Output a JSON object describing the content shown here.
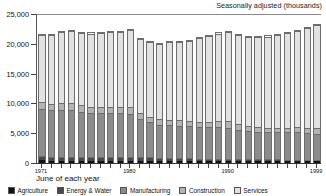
{
  "chart_data": {
    "type": "bar",
    "stacked": true,
    "title": "Seasonally adjusted (thousands)",
    "subtitle": "",
    "xlabel": "June of each year",
    "ylabel": "",
    "ylim": [
      0,
      25000
    ],
    "yticks": [
      0,
      5000,
      10000,
      15000,
      20000,
      25000
    ],
    "ytick_labels": [
      "0",
      "5,000",
      "10,000",
      "15,000",
      "20,000",
      "25,000"
    ],
    "grid": false,
    "legend_position": "bottom",
    "categories": [
      "1971",
      "1972",
      "1973",
      "1974",
      "1975",
      "1976",
      "1977",
      "1978",
      "1979",
      "1980",
      "1981",
      "1982",
      "1983",
      "1984",
      "1985",
      "1986",
      "1987",
      "1988",
      "1989",
      "1990",
      "1991",
      "1992",
      "1993",
      "1994",
      "1995",
      "1996",
      "1997",
      "1998",
      "1999"
    ],
    "xtick_labels": [
      "1971",
      "1980",
      "1990",
      "1999"
    ],
    "xtick_label_indices": [
      0,
      9,
      19,
      28
    ],
    "series": [
      {
        "name": "Agriculture",
        "color": "#121212",
        "values": [
          430,
          420,
          415,
          410,
          400,
          395,
          390,
          385,
          380,
          375,
          360,
          350,
          345,
          340,
          330,
          325,
          320,
          315,
          310,
          305,
          300,
          295,
          290,
          288,
          285,
          283,
          280,
          278,
          275
        ]
      },
      {
        "name": "Energy & Water",
        "color": "#4a4a4a",
        "values": [
          680,
          670,
          675,
          680,
          690,
          700,
          705,
          700,
          690,
          680,
          650,
          610,
          570,
          540,
          510,
          470,
          430,
          400,
          380,
          365,
          350,
          340,
          330,
          320,
          315,
          310,
          305,
          300,
          295
        ]
      },
      {
        "name": "Manufacturing",
        "color": "#8c8c8c",
        "values": [
          8100,
          7900,
          7950,
          7950,
          7600,
          7400,
          7450,
          7400,
          7400,
          7300,
          6450,
          5980,
          5600,
          5500,
          5500,
          5400,
          5280,
          5320,
          5360,
          5300,
          4960,
          4720,
          4600,
          4580,
          4600,
          4580,
          4600,
          4560,
          4400
        ]
      },
      {
        "name": "Construction",
        "color": "#b4b4b4",
        "values": [
          1100,
          1050,
          1100,
          1150,
          1080,
          1030,
          1000,
          1020,
          1030,
          1040,
          1000,
          900,
          880,
          880,
          880,
          900,
          930,
          980,
          1040,
          1060,
          950,
          850,
          800,
          790,
          800,
          810,
          830,
          860,
          880
        ]
      },
      {
        "name": "Services",
        "color": "#e2e2e2",
        "values": [
          11390,
          11560,
          11960,
          12110,
          12230,
          12375,
          12455,
          12575,
          12700,
          13105,
          12540,
          12660,
          12805,
          13240,
          13280,
          13605,
          14240,
          14485,
          14810,
          15170,
          15040,
          15095,
          15280,
          15422,
          15600,
          16017,
          16385,
          16802,
          17450
        ]
      }
    ],
    "totals": [
      21700,
      21600,
      22100,
      22300,
      22000,
      21900,
      22000,
      22080,
      22200,
      22500,
      21000,
      20500,
      20200,
      20500,
      20500,
      20700,
      21200,
      21500,
      21900,
      22200,
      21600,
      21300,
      21300,
      21400,
      21600,
      22000,
      22400,
      22800,
      23300
    ]
  },
  "legend": {
    "items": [
      {
        "label": "Agriculture"
      },
      {
        "label": "Energy & Water"
      },
      {
        "label": "Manufacturing"
      },
      {
        "label": "Construction"
      },
      {
        "label": "Services"
      }
    ]
  },
  "axes": {
    "x_title": "June of each year"
  }
}
